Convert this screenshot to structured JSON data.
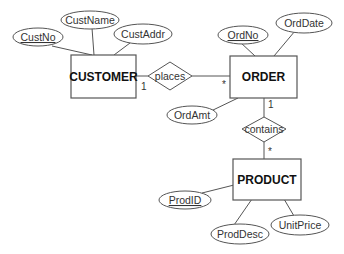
{
  "diagram": {
    "type": "entity-relationship",
    "entities": [
      {
        "id": "customer",
        "label": "CUSTOMER"
      },
      {
        "id": "order",
        "label": "ORDER"
      },
      {
        "id": "product",
        "label": "PRODUCT"
      }
    ],
    "relationships": [
      {
        "id": "places",
        "label": "places",
        "from": "CUSTOMER",
        "to": "ORDER",
        "from_card": "1",
        "to_card": "*"
      },
      {
        "id": "contains",
        "label": "contains",
        "from": "ORDER",
        "to": "PRODUCT",
        "from_card": "1",
        "to_card": "*"
      }
    ],
    "attributes": {
      "custno": {
        "label": "CustNo",
        "key": true
      },
      "custname": {
        "label": "CustName",
        "key": false
      },
      "custaddr": {
        "label": "CustAddr",
        "key": false
      },
      "ordno": {
        "label": "OrdNo",
        "key": true
      },
      "orddate": {
        "label": "OrdDate",
        "key": false
      },
      "ordamt": {
        "label": "OrdAmt",
        "key": false
      },
      "prodid": {
        "label": "ProdID",
        "key": true
      },
      "proddesc": {
        "label": "ProdDesc",
        "key": false
      },
      "unitprice": {
        "label": "UnitPrice",
        "key": false
      }
    },
    "cardinalities": {
      "customer_places": "1",
      "order_places": "*",
      "order_contains": "1",
      "product_contains": "*"
    }
  }
}
